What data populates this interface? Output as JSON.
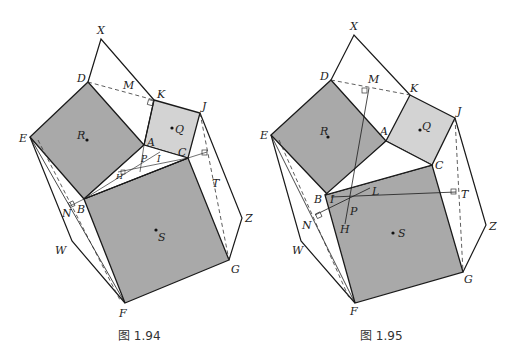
{
  "header": {
    "cropped_text": "图1.94和图1.95 中心正方形的面积等于另外两个正方形面积之和"
  },
  "figures": [
    {
      "caption": "图 1.94",
      "labels": {
        "X": "X",
        "D": "D",
        "M": "M",
        "K": "K",
        "J": "J",
        "E": "E",
        "R": "R",
        "Q": "Q",
        "A": "A",
        "C": "C",
        "P": "P",
        "I": "I",
        "H": "H",
        "N": "N",
        "B": "B",
        "T": "T",
        "Z": "Z",
        "W": "W",
        "S": "S",
        "G": "G",
        "F": "F"
      }
    },
    {
      "caption": "图 1.95",
      "labels": {
        "X": "X",
        "D": "D",
        "M": "M",
        "K": "K",
        "J": "J",
        "E": "E",
        "R": "R",
        "Q": "Q",
        "A": "A",
        "C": "C",
        "B": "B",
        "I": "I",
        "L": "L",
        "P": "P",
        "T": "T",
        "N": "N",
        "H": "H",
        "Z": "Z",
        "W": "W",
        "S": "S",
        "G": "G",
        "F": "F"
      }
    }
  ],
  "colors": {
    "square_dark": "#a9a9a9",
    "square_light": "#d0d0d0",
    "stroke": "#1a1a1a"
  }
}
